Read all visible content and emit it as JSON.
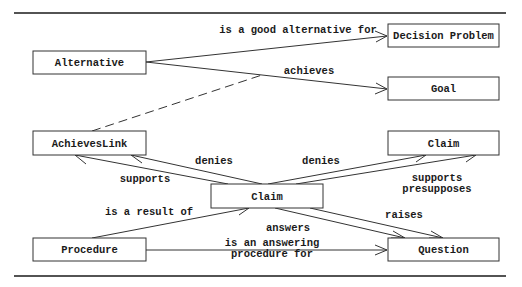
{
  "diagram": {
    "nodes": [
      {
        "id": "alternative",
        "label": "Alternative",
        "x": 33,
        "y": 51,
        "w": 113,
        "h": 23
      },
      {
        "id": "decision-problem",
        "label": "Decision Problem",
        "x": 388,
        "y": 24,
        "w": 111,
        "h": 23
      },
      {
        "id": "goal",
        "label": "Goal",
        "x": 388,
        "y": 77,
        "w": 111,
        "h": 23
      },
      {
        "id": "achieves-link",
        "label": "AchievesLink",
        "x": 33,
        "y": 131,
        "w": 113,
        "h": 24
      },
      {
        "id": "claim-top",
        "label": "Claim",
        "x": 388,
        "y": 131,
        "w": 111,
        "h": 24
      },
      {
        "id": "claim-center",
        "label": "Claim",
        "x": 211,
        "y": 184,
        "w": 112,
        "h": 24
      },
      {
        "id": "procedure",
        "label": "Procedure",
        "x": 33,
        "y": 238,
        "w": 113,
        "h": 23
      },
      {
        "id": "question",
        "label": "Question",
        "x": 388,
        "y": 238,
        "w": 111,
        "h": 23
      }
    ],
    "edges": [
      {
        "from": "alternative",
        "to": "decision-problem",
        "label": [
          "is a good alternative for"
        ],
        "style": "solid"
      },
      {
        "from": "alternative",
        "to": "goal",
        "label": [
          "achieves"
        ],
        "style": "solid"
      },
      {
        "from": "achieves-link",
        "to": "alternative-goal-edge",
        "label": [],
        "style": "dashed"
      },
      {
        "from": "claim-center",
        "to": "achieves-link",
        "label": [
          "supports"
        ],
        "style": "solid"
      },
      {
        "from": "claim-center",
        "to": "achieves-link",
        "label": [
          "denies"
        ],
        "style": "solid"
      },
      {
        "from": "claim-center",
        "to": "claim-top",
        "label": [
          "denies"
        ],
        "style": "solid"
      },
      {
        "from": "claim-center",
        "to": "claim-top",
        "label": [
          "supports",
          "presupposes"
        ],
        "style": "solid"
      },
      {
        "from": "procedure",
        "to": "claim-center",
        "label": [
          "is a result of"
        ],
        "style": "solid"
      },
      {
        "from": "claim-center",
        "to": "question",
        "label": [
          "answers"
        ],
        "style": "solid"
      },
      {
        "from": "claim-center",
        "to": "question",
        "label": [
          "raises"
        ],
        "style": "solid"
      },
      {
        "from": "procedure",
        "to": "question",
        "label": [
          "is an answering",
          "procedure for"
        ],
        "style": "solid"
      }
    ]
  },
  "labels": {
    "alternative": "Alternative",
    "decision_problem": "Decision Problem",
    "goal": "Goal",
    "achieves_link": "AchievesLink",
    "claim_top": "Claim",
    "claim_center": "Claim",
    "procedure": "Procedure",
    "question": "Question",
    "edge_good_alternative": "is a good alternative for",
    "edge_achieves": "achieves",
    "edge_supports_left": "supports",
    "edge_denies_left": "denies",
    "edge_denies_right": "denies",
    "edge_supports_right": "supports",
    "edge_presupposes_right": "presupposes",
    "edge_result_of": "is a result of",
    "edge_answers": "answers",
    "edge_raises": "raises",
    "edge_answering_1": "is an answering",
    "edge_answering_2": "procedure for"
  }
}
